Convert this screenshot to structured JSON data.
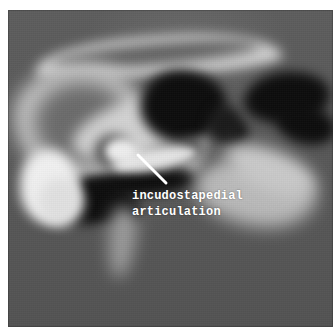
{
  "image": {
    "type": "ct-scan",
    "modality": "computed-tomography",
    "region": "temporal-bone",
    "orientation": "axial",
    "colormap": "grayscale",
    "background_color": "#565656",
    "bone_color": "#e0e0e0",
    "air_color": "#0d0d0d",
    "page_background": "#ffffff"
  },
  "annotation": {
    "label_line_1": "incudostapedial",
    "label_line_2": "articulation",
    "label_full": "incudostapedial articulation",
    "text_color": "#ffffff",
    "leader_line_color": "#ffffff",
    "leader_line": {
      "x1": 130,
      "y1": 145,
      "x2": 158,
      "y2": 173
    }
  }
}
